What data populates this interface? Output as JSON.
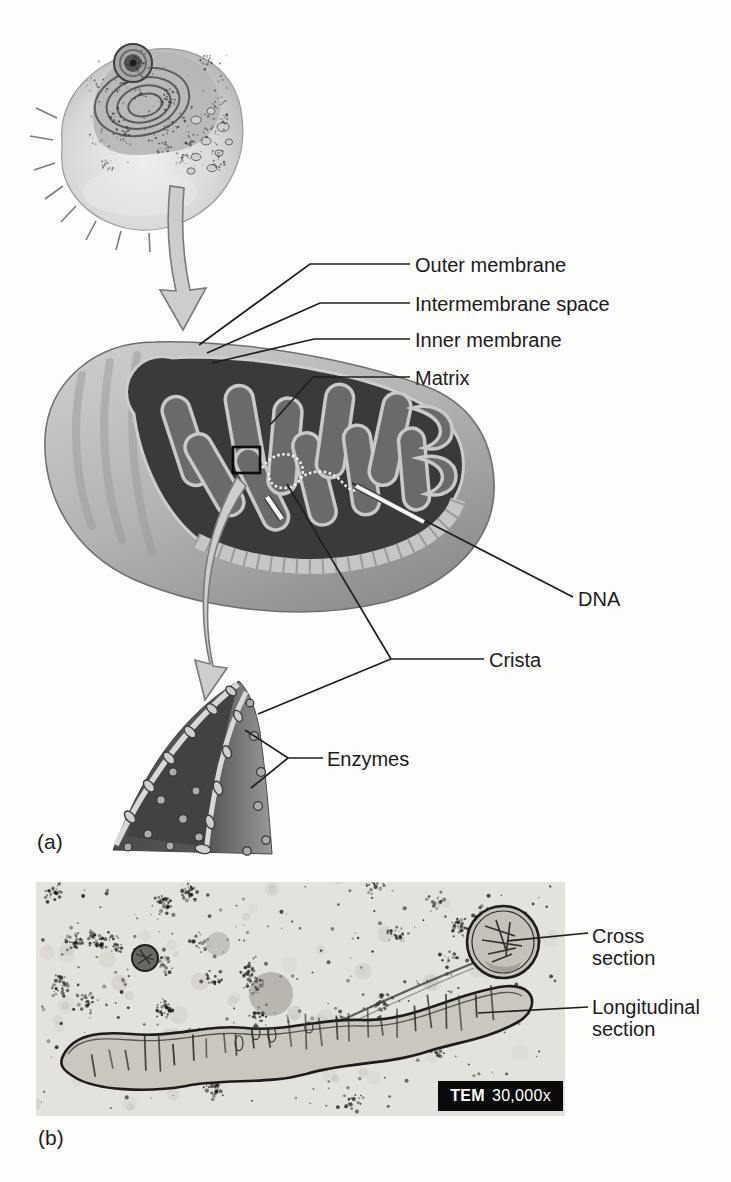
{
  "panel_a": {
    "tag": "(a)",
    "callouts": {
      "outer_membrane": "Outer membrane",
      "intermembrane_space": "Intermembrane space",
      "inner_membrane": "Inner membrane",
      "matrix": "Matrix",
      "dna": "DNA",
      "crista": "Crista",
      "enzymes": "Enzymes"
    }
  },
  "panel_b": {
    "tag": "(b)",
    "callouts": {
      "cross_section": "Cross section",
      "longitudinal_section": "Longitudinal section"
    },
    "badge": {
      "technique": "TEM",
      "magnification": "30,000x"
    }
  }
}
